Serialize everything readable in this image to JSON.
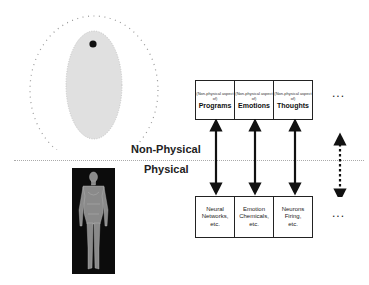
{
  "diagram": {
    "regions": {
      "non_physical_label": "Non-Physical",
      "physical_label": "Physical"
    },
    "top_boxes": [
      {
        "prefix": "(Non-physical aspect of)",
        "title": "Programs"
      },
      {
        "prefix": "(Non-physical aspect of)",
        "title": "Emotions"
      },
      {
        "prefix": "(Non-physical aspect of)",
        "title": "Thoughts"
      }
    ],
    "bottom_boxes": [
      {
        "lines": [
          "Neural",
          "Networks,",
          "etc."
        ]
      },
      {
        "lines": [
          "Emotion",
          "Chemicals,",
          "etc."
        ]
      },
      {
        "lines": [
          "Neurons",
          "Firing,",
          "etc."
        ]
      }
    ],
    "ellipsis_top": "...",
    "ellipsis_bottom": "...",
    "colors": {
      "ellipse_fill": "#e0e0e0",
      "dot": "#111111",
      "outline_dots": "#999999",
      "arrow": "#111111"
    }
  }
}
